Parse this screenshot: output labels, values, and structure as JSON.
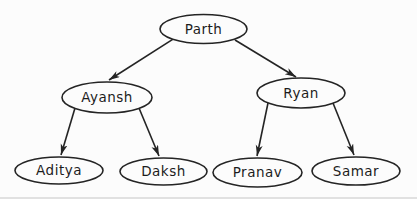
{
  "diagram": {
    "type": "tree",
    "background_color": "#fcfcfc",
    "stroke_color": "#242424",
    "text_color": "#1c1c1c",
    "nodes": [
      {
        "id": "parth",
        "label": "Parth",
        "cx": 203.5,
        "cy": 29,
        "rx": 43.5,
        "ry": 14.5
      },
      {
        "id": "ayansh",
        "label": "Ayansh",
        "cx": 107,
        "cy": 97.5,
        "rx": 45,
        "ry": 15.5
      },
      {
        "id": "ryan",
        "label": "Ryan",
        "cx": 301,
        "cy": 93,
        "rx": 44,
        "ry": 15
      },
      {
        "id": "aditya",
        "label": "Aditya",
        "cx": 59,
        "cy": 170.5,
        "rx": 44,
        "ry": 13.5
      },
      {
        "id": "daksh",
        "label": "Daksh",
        "cx": 163.5,
        "cy": 171.5,
        "rx": 43.5,
        "ry": 13.5
      },
      {
        "id": "pranav",
        "label": "Pranav",
        "cx": 257.5,
        "cy": 172.5,
        "rx": 44.5,
        "ry": 14.5
      },
      {
        "id": "samar",
        "label": "Samar",
        "cx": 356,
        "cy": 171,
        "rx": 44,
        "ry": 14
      }
    ],
    "edges": [
      {
        "from": "parth",
        "to": "ayansh",
        "x1": 172.7,
        "y1": 39.3,
        "x2": 109,
        "y2": 80
      },
      {
        "from": "parth",
        "to": "ryan",
        "x1": 235,
        "y1": 40,
        "x2": 296,
        "y2": 77
      },
      {
        "from": "ayansh",
        "to": "aditya",
        "x1": 75,
        "y1": 108,
        "x2": 61,
        "y2": 155
      },
      {
        "from": "ayansh",
        "to": "daksh",
        "x1": 139,
        "y1": 108,
        "x2": 159,
        "y2": 156
      },
      {
        "from": "ryan",
        "to": "pranav",
        "x1": 268,
        "y1": 103,
        "x2": 257,
        "y2": 156
      },
      {
        "from": "ryan",
        "to": "samar",
        "x1": 333,
        "y1": 103,
        "x2": 354,
        "y2": 155
      }
    ]
  }
}
